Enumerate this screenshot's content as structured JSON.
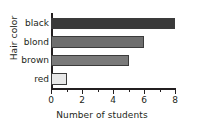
{
  "chart_data": {
    "type": "bar",
    "orientation": "horizontal",
    "title": "",
    "xlabel": "Number of students",
    "ylabel": "Hair color",
    "categories": [
      "black",
      "blond",
      "brown",
      "red"
    ],
    "values": [
      8,
      6,
      5,
      1
    ],
    "bar_colors": [
      "#3a3a3a",
      "#6e6e6e",
      "#7a7a7a",
      "#e8e8e8"
    ],
    "bar_border_color": "#3b3b3b",
    "xlim": [
      0,
      8
    ],
    "x_major_ticks": [
      0,
      2,
      4,
      6,
      8
    ],
    "x_major_tick_labels": [
      "0",
      "2",
      "4",
      "6",
      "8"
    ],
    "x_minor_ticks": [
      1,
      3,
      5,
      7
    ],
    "grid": false,
    "legend": "none",
    "axis_color": "#231f20",
    "background": "#ffffff"
  }
}
